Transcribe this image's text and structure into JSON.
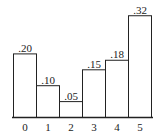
{
  "chart_data": {
    "type": "bar",
    "title": "",
    "xlabel": "",
    "ylabel": "",
    "categories": [
      "0",
      "1",
      "2",
      "3",
      "4",
      "5"
    ],
    "values": [
      0.2,
      0.1,
      0.05,
      0.15,
      0.18,
      0.32
    ],
    "value_labels": [
      ".20",
      ".10",
      ".05",
      ".15",
      ".18",
      ".32"
    ],
    "ylim": [
      0,
      0.35
    ],
    "grid": false,
    "legend": null,
    "bar_gap": 0
  }
}
